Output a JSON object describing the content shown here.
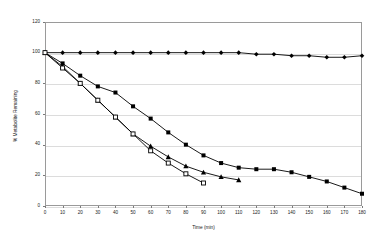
{
  "chart_data": {
    "type": "line",
    "title": "",
    "xlabel": "Time (min)",
    "ylabel": "% Metabolite Remaining",
    "xlim": [
      0,
      180
    ],
    "ylim": [
      0,
      120
    ],
    "xticks": [
      0,
      10,
      20,
      30,
      40,
      50,
      60,
      70,
      80,
      90,
      100,
      110,
      120,
      130,
      140,
      150,
      160,
      170,
      180
    ],
    "yticks": [
      0,
      20,
      40,
      60,
      80,
      100,
      120
    ],
    "grid": "horizontal",
    "legend": "none",
    "series": [
      {
        "name": "filled-diamond-series",
        "marker": "diamond-filled",
        "x": [
          0,
          10,
          20,
          30,
          40,
          50,
          60,
          70,
          80,
          90,
          100,
          110,
          120,
          130,
          140,
          150,
          160,
          170,
          180
        ],
        "y": [
          100,
          100,
          100,
          100,
          100,
          100,
          100,
          100,
          100,
          100,
          100,
          100,
          99,
          99,
          98,
          98,
          97,
          97,
          98
        ]
      },
      {
        "name": "filled-square-series",
        "marker": "square-filled",
        "x": [
          0,
          10,
          20,
          30,
          40,
          50,
          60,
          70,
          80,
          90,
          100,
          110,
          120,
          130,
          140,
          150,
          160,
          170,
          180
        ],
        "y": [
          100,
          93,
          85,
          78,
          74,
          65,
          57,
          48,
          40,
          33,
          28,
          25,
          24,
          24,
          22,
          19,
          16,
          12,
          8
        ]
      },
      {
        "name": "filled-triangle-series",
        "marker": "triangle-filled",
        "x": [
          0,
          10,
          20,
          30,
          40,
          50,
          60,
          70,
          80,
          90,
          100,
          110
        ],
        "y": [
          100,
          91,
          80,
          69,
          58,
          47,
          39,
          32,
          26,
          22,
          19,
          17
        ]
      },
      {
        "name": "open-square-series",
        "marker": "square-open",
        "x": [
          0,
          10,
          20,
          30,
          40,
          50,
          60,
          70,
          80,
          90
        ],
        "y": [
          100,
          90,
          80,
          69,
          58,
          47,
          36,
          28,
          21,
          15
        ]
      }
    ]
  },
  "axis": {
    "y_tick_labels": [
      "0",
      "20",
      "40",
      "60",
      "80",
      "100",
      "120"
    ],
    "x_tick_labels": [
      "0",
      "10",
      "20",
      "30",
      "40",
      "50",
      "60",
      "70",
      "80",
      "90",
      "100",
      "110",
      "120",
      "130",
      "140",
      "150",
      "160",
      "170",
      "180"
    ]
  },
  "colors": {
    "series_stroke": "#000000",
    "frame": "#9a9a9a",
    "gridline": "#dcdcdc",
    "text": "#1a1a1a",
    "background": "#ffffff"
  }
}
